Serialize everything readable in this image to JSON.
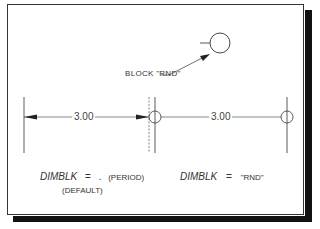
{
  "figure": {
    "block_label": "BLOCK \"RND\"",
    "left_example": {
      "dimension_text": "3.00",
      "caption_var": "DIMBLK",
      "caption_eq": "=",
      "caption_value": ".",
      "caption_note": "(PERIOD)",
      "caption_default": "(DEFAULT)",
      "terminator": "arrow"
    },
    "right_example": {
      "dimension_text": "3.00",
      "caption_var": "DIMBLK",
      "caption_eq": "=",
      "caption_value": "\"RND\"",
      "terminator": "circle"
    }
  },
  "colors": {
    "line": "#333333",
    "shadow": "#111111",
    "background": "#ffffff"
  }
}
